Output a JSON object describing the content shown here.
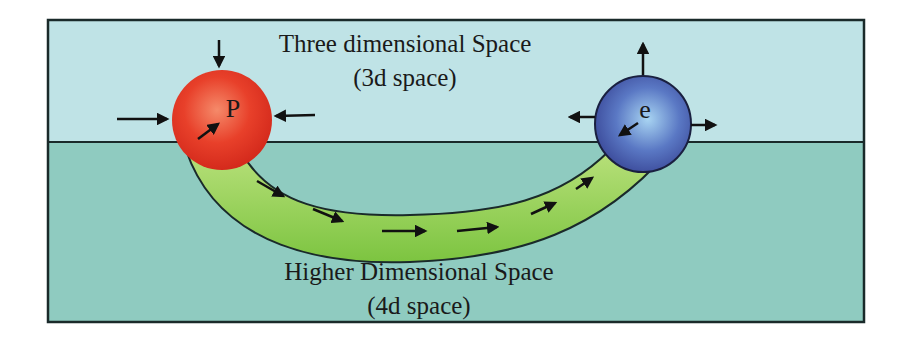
{
  "diagram": {
    "upper_region": {
      "title": "Three dimensional Space",
      "subtitle": "(3d space)",
      "color": "#bfe3e6"
    },
    "lower_region": {
      "title": "Higher Dimensional Space",
      "subtitle": "(4d space)",
      "color": "#8fcbc0"
    },
    "particle_p": {
      "label": "P",
      "color": "#e8402a",
      "arrows": "inward"
    },
    "particle_e": {
      "label": "e",
      "color": "#4a5fb0",
      "arrows": "outward"
    },
    "tunnel": {
      "color": "#8ccf4a",
      "direction": "P to e"
    }
  }
}
